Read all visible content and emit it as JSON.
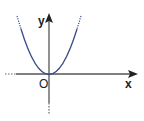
{
  "diagram": {
    "axes": {
      "x_label": "x",
      "y_label": "y",
      "origin_label": "O"
    },
    "curve": {
      "type": "parabola",
      "equation": "y = x^2",
      "vertex": "O",
      "color": "#3a4a8c"
    },
    "axis_color": "#555555"
  }
}
